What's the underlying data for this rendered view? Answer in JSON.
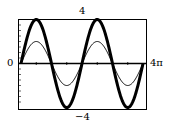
{
  "chart_data": {
    "type": "line",
    "title": "",
    "xlabel": "",
    "ylabel": "",
    "xlim": [
      0,
      12.566
    ],
    "ylim": [
      -4,
      4
    ],
    "x_tick_labels": {
      "left": "0",
      "right": "4π"
    },
    "y_tick_labels": {
      "top": "4",
      "bottom": "−4"
    },
    "grid": false,
    "legend": null,
    "series": [
      {
        "name": "thick curve",
        "function": "y = 4 sin(x) (amplitude inferred)",
        "amplitude": 4,
        "amplitude_note": "Drawn at 4 to match the axis label; measured pixel peak/trough reads ~3.6–3.7. Heavy stroke weight makes the exact amplitude uncertain.",
        "measured_amplitude_estimate": 3.65,
        "period": 6.2832,
        "stroke": "thick",
        "color": "#000000",
        "points": [
          [
            0,
            0
          ],
          [
            1.5708,
            4
          ],
          [
            3.1416,
            0
          ],
          [
            4.7124,
            -4
          ],
          [
            6.2832,
            0
          ],
          [
            7.854,
            4
          ],
          [
            9.4248,
            0
          ],
          [
            10.9956,
            -4
          ],
          [
            12.566,
            0
          ]
        ]
      },
      {
        "name": "thin curve",
        "function": "y = 2 sin(x) (amplitude estimated)",
        "amplitude": 2,
        "amplitude_note": "Measured pixel peak/trough reads ~1.8, consistent with 2.",
        "measured_amplitude_estimate": 1.8,
        "period": 6.2832,
        "stroke": "thin",
        "color": "#000000",
        "points": [
          [
            0,
            0
          ],
          [
            1.5708,
            2
          ],
          [
            3.1416,
            0
          ],
          [
            4.7124,
            -2
          ],
          [
            6.2832,
            0
          ],
          [
            7.854,
            2
          ],
          [
            9.4248,
            0
          ],
          [
            10.9956,
            -2
          ],
          [
            12.566,
            0
          ]
        ]
      }
    ]
  },
  "labels": {
    "y_max": "4",
    "y_min": "−4",
    "x_min": "0",
    "x_max": "4π"
  }
}
